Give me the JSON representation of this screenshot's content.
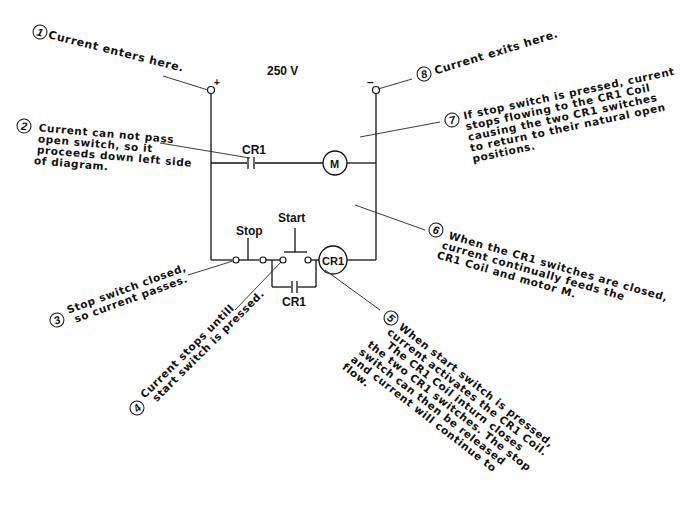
{
  "diagram": {
    "voltage_label": "250 V",
    "positive_terminal": "+",
    "negative_terminal": "–",
    "components": {
      "cr1_top_contact": "CR1",
      "motor": "M",
      "stop_switch": "Stop",
      "start_switch": "Start",
      "cr1_coil": "CR1",
      "cr1_parallel_contact": "CR1"
    },
    "notes": [
      {
        "number": "1",
        "lines": [
          "Current enters here."
        ]
      },
      {
        "number": "2",
        "lines": [
          "Current can not pass",
          "open switch, so it",
          "proceeds down left side",
          "of diagram."
        ]
      },
      {
        "number": "3",
        "lines": [
          "Stop switch closed,",
          "so current passes."
        ]
      },
      {
        "number": "4",
        "lines": [
          "Current stops untill",
          "start switch is pressed."
        ]
      },
      {
        "number": "5",
        "lines": [
          "When start switch is pressed,",
          "current activates the CR1 Coil.",
          "The CR1 Coil inturn closes",
          "the two CR1 switches. The stop",
          "switch can then be released",
          "and current will continue to",
          "flow."
        ]
      },
      {
        "number": "6",
        "lines": [
          "When the CR1 switches are closed,",
          "current continually feeds the",
          "CR1 Coil and motor M."
        ]
      },
      {
        "number": "7",
        "lines": [
          "If stop switch is pressed, current",
          "stops flowing to the CR1 Coil",
          "causing the two CR1 switches",
          "to return to their natural open",
          "positions."
        ]
      },
      {
        "number": "8",
        "lines": [
          "Current exits here."
        ]
      }
    ]
  }
}
